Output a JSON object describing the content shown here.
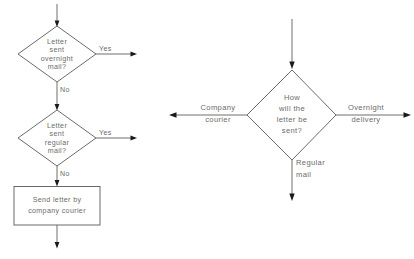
{
  "diagram": {
    "type": "flowchart",
    "title": "",
    "background_color": "#ffffff",
    "line_color": "#5a5a5a",
    "text_color": "#6b6b6b",
    "charts": [
      {
        "id": "left-flowchart",
        "name": "sequential-binary-decision-flowchart",
        "nodes": [
          {
            "id": "d1",
            "shape": "diamond",
            "lines": [
              "Letter",
              "sent",
              "overnight",
              "mail?"
            ]
          },
          {
            "id": "d2",
            "shape": "diamond",
            "lines": [
              "Letter",
              "sent",
              "regular",
              "mail?"
            ]
          },
          {
            "id": "p1",
            "shape": "rectangle",
            "lines": [
              "Send letter by",
              "company courier"
            ]
          }
        ],
        "edge_labels": {
          "d1_yes": "Yes",
          "d1_no": "No",
          "d2_yes": "Yes",
          "d2_no": "No"
        }
      },
      {
        "id": "right-flowchart",
        "name": "multiway-decision-flowchart",
        "nodes": [
          {
            "id": "d3",
            "shape": "diamond",
            "lines": [
              "How",
              "will the",
              "letter be",
              "sent?"
            ]
          }
        ],
        "edge_labels": {
          "left_branch_line1": "Company",
          "left_branch_line2": "courier",
          "right_branch_line1": "Overnight",
          "right_branch_line2": "delivery",
          "bottom_branch_line1": "Regular",
          "bottom_branch_line2": "mail"
        }
      }
    ]
  }
}
